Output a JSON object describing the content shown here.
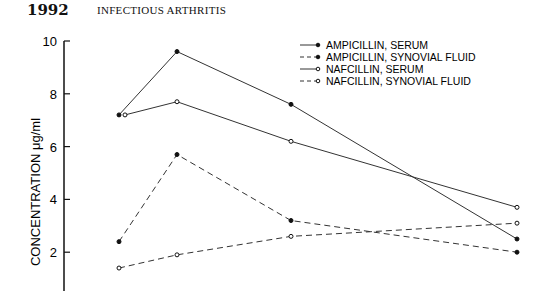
{
  "header": {
    "page_number": "1992",
    "running_title": "INFECTIOUS ARTHRITIS"
  },
  "chart_data": {
    "type": "line",
    "title": "",
    "xlabel": "",
    "ylabel": "CONCENTRATION μg/ml",
    "yticks": [
      "2",
      "4",
      "6",
      "8",
      "10"
    ],
    "ylim": [
      0,
      10
    ],
    "x": [
      1,
      2,
      3,
      4
    ],
    "grid": false,
    "legend_position": "top-right",
    "series": [
      {
        "name": "AMPICILLIN, SERUM",
        "style": "solid",
        "marker": "filled",
        "values": [
          7.2,
          9.6,
          7.6,
          2.5
        ]
      },
      {
        "name": "AMPICILLIN, SYNOVIAL FLUID",
        "style": "dashed",
        "marker": "filled",
        "values": [
          2.4,
          5.7,
          3.2,
          2.0
        ]
      },
      {
        "name": "NAFCILLIN, SERUM",
        "style": "solid",
        "marker": "open",
        "values": [
          7.2,
          7.7,
          6.2,
          3.7
        ]
      },
      {
        "name": "NAFCILLIN, SYNOVIAL FLUID",
        "style": "dashed",
        "marker": "open",
        "values": [
          1.4,
          1.9,
          2.6,
          3.1
        ]
      }
    ]
  }
}
